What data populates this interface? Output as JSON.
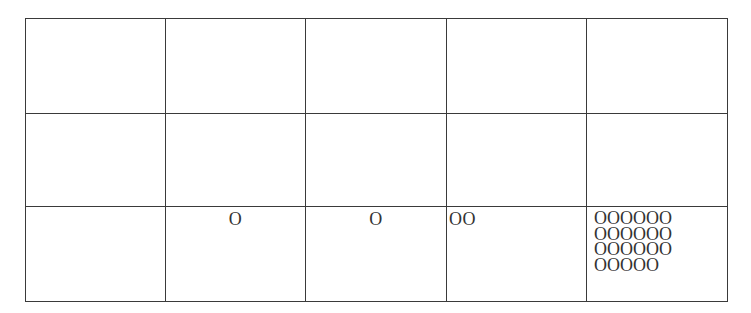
{
  "grid": {
    "rows": 3,
    "columns": 5,
    "cells": [
      [
        "",
        "",
        "",
        "",
        ""
      ],
      [
        "",
        "",
        "",
        "",
        ""
      ],
      [
        "",
        "O",
        "O",
        "OO",
        "OOOOOO\nOOOOOO\nOOOOOO\nOOOOO"
      ]
    ],
    "row3_counts": [
      0,
      1,
      1,
      2,
      23
    ]
  },
  "colors": {
    "border": "#3a3a3a",
    "text": "#333333",
    "background": "#ffffff"
  }
}
